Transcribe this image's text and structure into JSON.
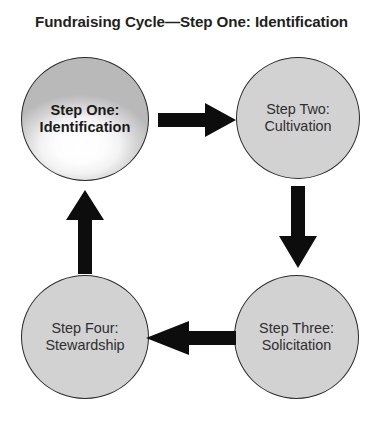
{
  "diagram": {
    "title": "Fundraising Cycle—Step One: Identification",
    "type": "cycle-flow-diagram",
    "accent_color": "#d2d2d2",
    "arrow_color": "#0d0d0d",
    "text_color": "#231f20",
    "nodes": [
      {
        "id": "step-one",
        "line1": "Step One:",
        "line2": "Identification",
        "highlighted": true,
        "style": "glossy-white-sphere"
      },
      {
        "id": "step-two",
        "line1": "Step Two:",
        "line2": "Cultivation",
        "highlighted": false,
        "style": "flat-gray"
      },
      {
        "id": "step-three",
        "line1": "Step Three:",
        "line2": "Solicitation",
        "highlighted": false,
        "style": "flat-gray"
      },
      {
        "id": "step-four",
        "line1": "Step Four:",
        "line2": "Stewardship",
        "highlighted": false,
        "style": "flat-gray"
      }
    ],
    "arrows": [
      {
        "id": "one-to-two",
        "from": "step-one",
        "to": "step-two",
        "direction": "right"
      },
      {
        "id": "two-to-three",
        "from": "step-two",
        "to": "step-three",
        "direction": "down"
      },
      {
        "id": "three-to-four",
        "from": "step-three",
        "to": "step-four",
        "direction": "left"
      },
      {
        "id": "four-to-one",
        "from": "step-four",
        "to": "step-one",
        "direction": "up"
      }
    ]
  }
}
